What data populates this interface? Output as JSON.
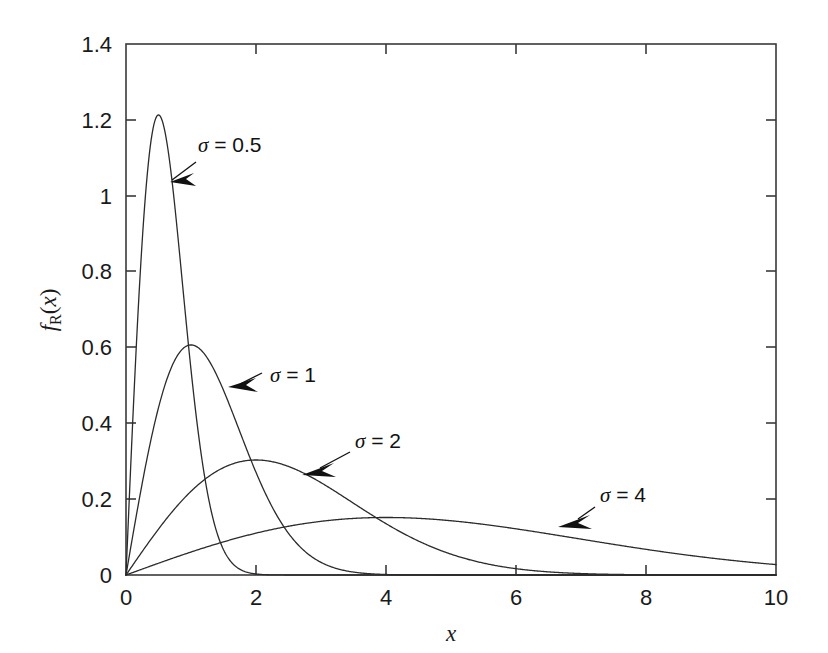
{
  "figure": {
    "background_color": "#ffffff",
    "axis_color": "#3a3a3a",
    "curve_color": "#2b2b2b",
    "annotation_color": "#111111"
  },
  "axes": {
    "x_title": "x",
    "y_title_main": "f",
    "y_title_sub": "R",
    "y_title_arg_open": "(",
    "y_title_arg": "x",
    "y_title_arg_close": ")",
    "x_tick_labels": [
      "0",
      "2",
      "4",
      "6",
      "8",
      "10"
    ],
    "y_tick_labels": [
      "0",
      "0.2",
      "0.4",
      "0.6",
      "0.8",
      "1",
      "1.2",
      "1.4"
    ]
  },
  "annotations": [
    {
      "name": "sigma-0p5",
      "sigma_symbol": "σ",
      "equals": " = ",
      "value": "0.5"
    },
    {
      "name": "sigma-1",
      "sigma_symbol": "σ",
      "equals": " = ",
      "value": "1"
    },
    {
      "name": "sigma-2",
      "sigma_symbol": "σ",
      "equals": " = ",
      "value": "2"
    },
    {
      "name": "sigma-4",
      "sigma_symbol": "σ",
      "equals": " = ",
      "value": "4"
    }
  ],
  "chart_data": {
    "type": "line",
    "title": "",
    "xlabel": "x",
    "ylabel": "f_R(x)",
    "xlim": [
      0,
      10
    ],
    "ylim": [
      0,
      1.4
    ],
    "xticks": [
      0,
      2,
      4,
      6,
      8,
      10
    ],
    "yticks": [
      0,
      0.2,
      0.4,
      0.6,
      0.8,
      1.0,
      1.2,
      1.4
    ],
    "grid": false,
    "legend": "inline-arrow-annotations",
    "distribution": "Rayleigh probability density function",
    "formula": "f_R(x) = (x / sigma^2) * exp(-x^2 / (2 * sigma^2))",
    "series": [
      {
        "name": "σ = 0.5",
        "sigma": 0.5,
        "peak_x": 0.5,
        "peak_y": 1.2131,
        "x": [
          0,
          0.1,
          0.2,
          0.3,
          0.4,
          0.5,
          0.6,
          0.7,
          0.8,
          0.9,
          1.0,
          1.1,
          1.2,
          1.3,
          1.4,
          1.5,
          1.6,
          1.7,
          1.8,
          1.9,
          2.0,
          2.2,
          2.4,
          2.6,
          2.8,
          3.0
        ],
        "y": [
          0,
          0.3921,
          0.7261,
          0.9524,
          1.0617,
          1.0852,
          1.042,
          0.9562,
          0.8486,
          0.734,
          0.6215,
          0.5163,
          0.4213,
          0.338,
          0.2668,
          0.2075,
          0.1591,
          0.1204,
          0.09,
          0.0664,
          0.0484,
          0.0247,
          0.0121,
          0.0057,
          0.0026,
          0.0011
        ]
      },
      {
        "name": "σ = 1",
        "sigma": 1,
        "peak_x": 1.0,
        "peak_y": 0.6065,
        "x": [
          0,
          0.2,
          0.4,
          0.6,
          0.8,
          1.0,
          1.2,
          1.4,
          1.6,
          1.8,
          2.0,
          2.2,
          2.4,
          2.6,
          2.8,
          3.0,
          3.2,
          3.4,
          3.6,
          3.8,
          4.0,
          4.4,
          4.8,
          5.2,
          5.6,
          6.0
        ],
        "y": [
          0,
          0.196,
          0.3697,
          0.5026,
          0.5814,
          0.6065,
          0.5858,
          0.5312,
          0.4566,
          0.374,
          0.2707,
          0.2189,
          0.1668,
          0.1224,
          0.0866,
          0.0333,
          0.0377,
          0.0249,
          0.0159,
          0.0099,
          0.006,
          0.002,
          0.0006,
          0.0002,
          0.0001,
          0.0
        ]
      },
      {
        "name": "σ = 2",
        "sigma": 2,
        "peak_x": 2.0,
        "peak_y": 0.3033,
        "x": [
          0,
          0.5,
          1.0,
          1.5,
          2.0,
          2.5,
          3.0,
          3.5,
          4.0,
          4.5,
          5.0,
          5.5,
          6.0,
          6.5,
          7.0,
          7.5,
          8.0,
          8.5,
          9.0,
          9.5,
          10.0
        ],
        "y": [
          0,
          0.1212,
          0.2206,
          0.28,
          0.3033,
          0.2977,
          0.272,
          0.2351,
          0.1947,
          0.1554,
          0.1197,
          0.0892,
          0.0645,
          0.0453,
          0.0309,
          0.0205,
          0.0133,
          0.0084,
          0.0052,
          0.0031,
          0.0018
        ]
      },
      {
        "name": "σ = 4",
        "sigma": 4,
        "peak_x": 4.0,
        "peak_y": 0.1516,
        "x": [
          0,
          0.5,
          1.0,
          1.5,
          2.0,
          2.5,
          3.0,
          3.5,
          4.0,
          4.5,
          5.0,
          5.5,
          6.0,
          6.5,
          7.0,
          7.5,
          8.0,
          8.5,
          9.0,
          9.5,
          10.0
        ],
        "y": [
          0,
          0.0307,
          0.0606,
          0.0888,
          0.1147,
          0.1375,
          0.1567,
          0.1718,
          0.1516,
          0.1394,
          0.1251,
          0.1094,
          0.0929,
          0.0765,
          0.0607,
          0.0462,
          0.0333,
          0.0224,
          0.0142,
          0.0085,
          0.0048
        ]
      }
    ]
  }
}
